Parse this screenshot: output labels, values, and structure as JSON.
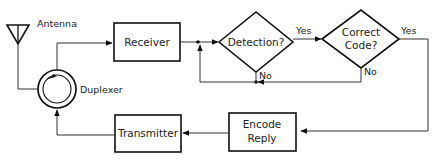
{
  "diagram": {
    "type": "block-flow",
    "nodes": {
      "antenna": {
        "label": "Antenna"
      },
      "duplexer": {
        "label": "Duplexer"
      },
      "receiver": {
        "label": "Receiver"
      },
      "detection": {
        "label": "Detection?"
      },
      "correct_code": {
        "line1": "Correct",
        "line2": "Code?"
      },
      "encode_reply": {
        "line1": "Encode",
        "line2": "Reply"
      },
      "transmitter": {
        "label": "Transmitter"
      }
    },
    "edge_labels": {
      "detection_yes": "Yes",
      "detection_no": "No",
      "code_yes": "Yes",
      "code_no": "No"
    },
    "colors": {
      "stroke": "#111111",
      "line": "#333333",
      "background": "#ffffff"
    }
  }
}
